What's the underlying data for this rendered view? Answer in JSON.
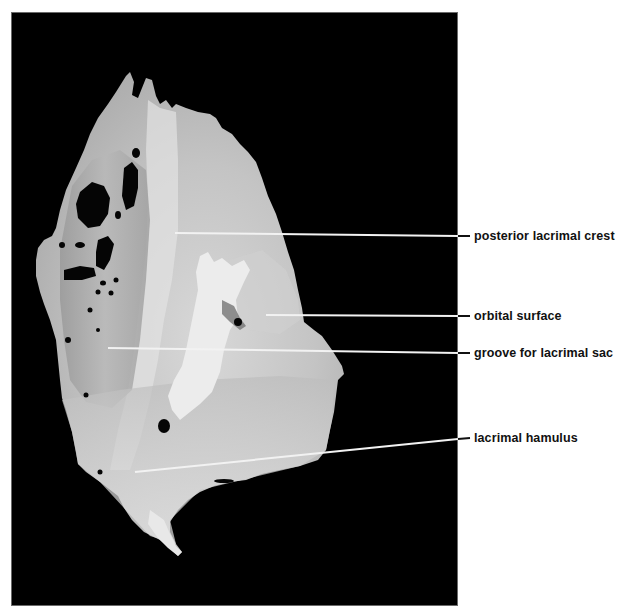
{
  "figure": {
    "background_color": "#000000",
    "page_color": "#ffffff",
    "leader_line_color_on_photo": "#f2f2f2",
    "leader_line_color_on_page": "#111111",
    "labels": [
      {
        "id": "posterior-lacrimal-crest",
        "text": "posterior lacrimal crest",
        "y": 236
      },
      {
        "id": "orbital-surface",
        "text": "orbital surface",
        "y": 316
      },
      {
        "id": "groove-for-lacrimal-sac",
        "text": "groove for lacrimal sac",
        "y": 353
      },
      {
        "id": "lacrimal-hamulus",
        "text": "lacrimal hamulus",
        "y": 439
      }
    ]
  }
}
